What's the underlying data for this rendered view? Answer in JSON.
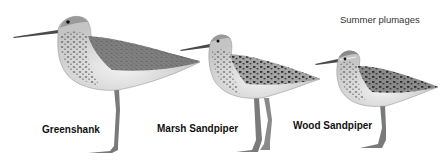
{
  "caption": "Summer plumages",
  "birds": [
    {
      "name": "Greenshank"
    },
    {
      "name": "Marsh Sandpiper"
    },
    {
      "name": "Wood Sandpiper"
    }
  ],
  "colors": {
    "background": "#ffffff",
    "plumage_light": "#d9d9d9",
    "plumage_mid": "#9a9a9a",
    "plumage_dark": "#3a3a3a",
    "legs": "#7a7a7a",
    "text": "#111111"
  }
}
